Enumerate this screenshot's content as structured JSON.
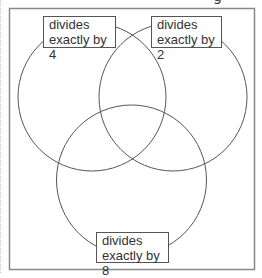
{
  "diagram": {
    "type": "venn",
    "sets": [
      {
        "id": "by4",
        "label_line1": "divides",
        "label_line2": "exactly by 4"
      },
      {
        "id": "by2",
        "label_line1": "divides",
        "label_line2": "exactly by 2"
      },
      {
        "id": "by8",
        "label_line1": "divides",
        "label_line2": "exactly by 8"
      }
    ],
    "heading_fragment": "g",
    "colors": {
      "stroke": "#555555",
      "frame": "#888888",
      "background": "#ffffff"
    }
  }
}
